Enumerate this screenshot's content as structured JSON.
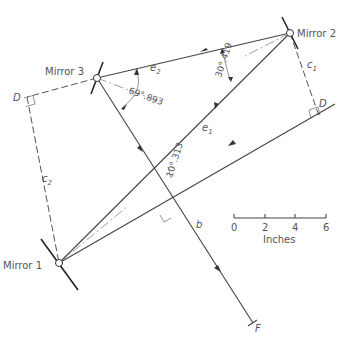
{
  "diagram": {
    "mirrors": [
      {
        "label": "Mirror 1"
      },
      {
        "label": "Mirror 2"
      },
      {
        "label": "Mirror 3"
      }
    ],
    "beam_labels": {
      "e1": "e",
      "e1_sub": "1",
      "e2": "e",
      "e2_sub": "2",
      "b": "b",
      "c1": "c",
      "c1_sub": "1",
      "c2": "c",
      "c2_sub": "2",
      "D_left": "D",
      "D_right": "D",
      "F": "F"
    },
    "angles": {
      "mirror3": "69°.893",
      "mirror2": "30°.419",
      "center": "10°.313"
    },
    "scale_bar": {
      "ticks": [
        "0",
        "2",
        "4",
        "6"
      ],
      "unit": "Inches"
    }
  }
}
